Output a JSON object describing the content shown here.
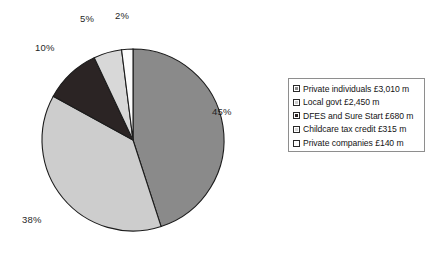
{
  "chart_data": {
    "type": "pie",
    "title": "",
    "subtitle": "",
    "xlabel": "",
    "ylabel": "",
    "legend_position": "right",
    "grid": false,
    "start_angle_deg": 0,
    "direction": "clockwise",
    "categories": [
      "Private individuals",
      "Local govt",
      "DFES and Sure Start",
      "Childcare tax credit",
      "Private companies"
    ],
    "values": [
      45,
      38,
      10,
      5,
      2
    ],
    "value_unit": "%",
    "amounts_gbp_millions": [
      3010,
      2450,
      680,
      315,
      140
    ],
    "amount_labels": [
      "£3,010 m",
      "£2,450 m",
      "£680 m",
      "£315 m",
      "£140 m"
    ],
    "data_labels": [
      "45%",
      "38%",
      "10%",
      "5%",
      "2%"
    ],
    "colors": [
      "#8a8a8a",
      "#cdcdcd",
      "#2b2424",
      "#d8d8d8",
      "#fcfcfc"
    ],
    "slice_border_color": "#1c1c1c",
    "legend_entries": [
      "Private individuals £3,010 m",
      "Local govt £2,450 m",
      "DFES and Sure Start £680 m",
      "Childcare tax credit £315 m",
      "Private companies £140 m"
    ]
  },
  "pie": {
    "labels": {
      "p45": "45%",
      "p38": "38%",
      "p10": "10%",
      "p5": "5%",
      "p2": "2%"
    }
  },
  "legend": {
    "rows": [
      {
        "label": "Private individuals £3,010 m",
        "color": "#8a8a8a"
      },
      {
        "label": "Local govt £2,450 m",
        "color": "#cdcdcd"
      },
      {
        "label": "DFES and Sure Start £680 m",
        "color": "#2b2424"
      },
      {
        "label": "Childcare tax credit £315 m",
        "color": "#d8d8d8"
      },
      {
        "label": "Private companies £140 m",
        "color": "#fcfcfc"
      }
    ]
  }
}
